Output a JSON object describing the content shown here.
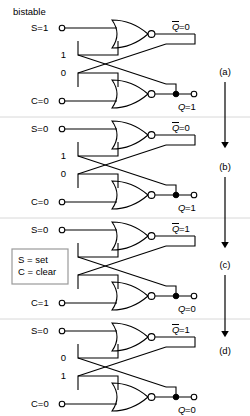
{
  "figure": {
    "title": "bistable",
    "legend": {
      "line1": "S = set",
      "line2": "C = clear"
    },
    "step_labels": [
      "(a)",
      "(b)",
      "(c)",
      "(d)"
    ]
  },
  "panels": [
    {
      "id": "a",
      "step_label": "(a)",
      "input_top": "S=1",
      "input_bottom": "C=0",
      "feedback_top": "1",
      "feedback_bottom": "0",
      "output_top": "Q̄=0",
      "output_top_base": "Q",
      "output_top_value": "=0",
      "output_bottom": "Q=1",
      "output_bottom_base": "Q",
      "output_bottom_value": "=1"
    },
    {
      "id": "b",
      "step_label": "(b)",
      "input_top": "S=0",
      "input_bottom": "C=0",
      "feedback_top": "1",
      "feedback_bottom": "0",
      "output_top": "Q̄=0",
      "output_top_base": "Q",
      "output_top_value": "=0",
      "output_bottom": "Q=1",
      "output_bottom_base": "Q",
      "output_bottom_value": "=1"
    },
    {
      "id": "c",
      "step_label": "(c)",
      "input_top": "S=0",
      "input_bottom": "C=1",
      "feedback_top": "0",
      "feedback_bottom": "1",
      "output_top": "Q̄=1",
      "output_top_base": "Q",
      "output_top_value": "=1",
      "output_bottom": "Q=0",
      "output_bottom_base": "Q",
      "output_bottom_value": "=0"
    },
    {
      "id": "d",
      "step_label": "(d)",
      "input_top": "S=0",
      "input_bottom": "C=0",
      "feedback_top": "0",
      "feedback_bottom": "1",
      "output_top": "Q̄=1",
      "output_top_base": "Q",
      "output_top_value": "=1",
      "output_bottom": "Q=0",
      "output_bottom_base": "Q",
      "output_bottom_value": "=0"
    }
  ],
  "colors": {
    "line": "#000000",
    "background": "#ffffff",
    "divider": "#d8d8d8",
    "legend_border": "#9a9a9a"
  }
}
